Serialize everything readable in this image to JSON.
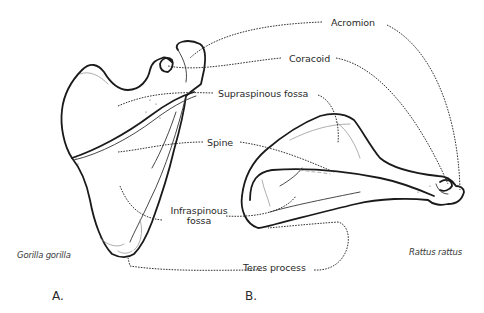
{
  "figure": {
    "labels": {
      "acromion": "Acromion",
      "coracoid": "Coracoid",
      "supraspinous_fossa": "Supraspinous fossa",
      "spine": "Spine",
      "infraspinous_fossa_line1": "Infraspinous",
      "infraspinous_fossa_line2": "fossa",
      "teres_process": "Teres process"
    },
    "panels": [
      {
        "id": "A",
        "label": "A.",
        "species": "Gorilla gorilla"
      },
      {
        "id": "B",
        "label": "B.",
        "species": "Rattus rattus"
      }
    ],
    "colors": {
      "line": "#1a1a1a",
      "text": "#2a2a2a",
      "background": "#ffffff"
    }
  }
}
